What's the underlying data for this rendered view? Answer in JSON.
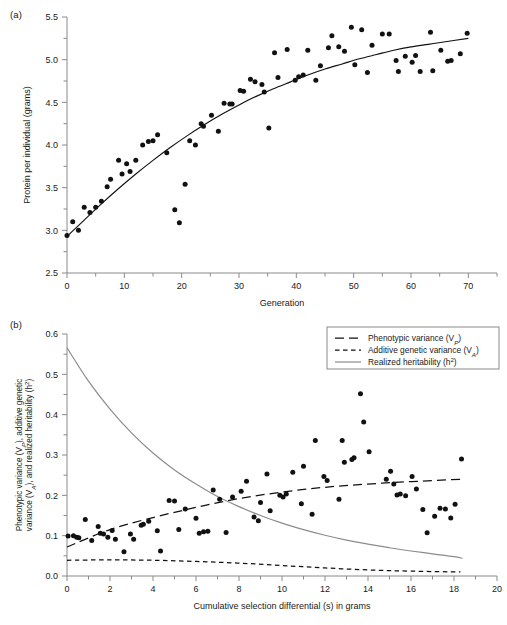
{
  "figure": {
    "panel_a_label": "(a)",
    "panel_b_label": "(b)"
  },
  "chart_data": [
    {
      "id": "panel-a",
      "type": "scatter",
      "title": "",
      "xlabel": "Generation",
      "ylabel": "Protein per individual (grams)",
      "xlim": [
        0,
        75
      ],
      "ylim": [
        2.5,
        5.5
      ],
      "xticks": [
        0,
        10,
        20,
        30,
        40,
        50,
        60,
        70
      ],
      "xticklabels": [
        "0",
        "10",
        "20",
        "30",
        "40",
        "50",
        "60",
        "70"
      ],
      "xminor_step": 5,
      "yticks": [
        2.5,
        3.0,
        3.5,
        4.0,
        4.5,
        5.0,
        5.5
      ],
      "yticklabels": [
        "2.5",
        "3.0",
        "3.5",
        "4.0",
        "4.5",
        "5.0",
        "5.5"
      ],
      "yminor_step": 0.25,
      "grid": false,
      "legend": "none",
      "points": [
        [
          0,
          2.94
        ],
        [
          1,
          3.1
        ],
        [
          2,
          3.0
        ],
        [
          3,
          3.27
        ],
        [
          4,
          3.21
        ],
        [
          5,
          3.27
        ],
        [
          6,
          3.34
        ],
        [
          7,
          3.51
        ],
        [
          7.6,
          3.6
        ],
        [
          9,
          3.82
        ],
        [
          9.6,
          3.66
        ],
        [
          10.4,
          3.78
        ],
        [
          11,
          3.69
        ],
        [
          12,
          3.82
        ],
        [
          13.2,
          4.0
        ],
        [
          14.2,
          4.04
        ],
        [
          15,
          4.05
        ],
        [
          15.8,
          4.12
        ],
        [
          17.4,
          3.91
        ],
        [
          18.8,
          3.24
        ],
        [
          19.6,
          3.09
        ],
        [
          20.6,
          3.54
        ],
        [
          21.4,
          4.05
        ],
        [
          22.4,
          4.0
        ],
        [
          23.4,
          4.25
        ],
        [
          23.8,
          4.22
        ],
        [
          25.2,
          4.35
        ],
        [
          26.4,
          4.16
        ],
        [
          27.4,
          4.49
        ],
        [
          28.4,
          4.48
        ],
        [
          28.8,
          4.48
        ],
        [
          30.2,
          4.64
        ],
        [
          30.8,
          4.63
        ],
        [
          32.0,
          4.77
        ],
        [
          32.8,
          4.74
        ],
        [
          34.0,
          4.71
        ],
        [
          34.4,
          4.62
        ],
        [
          35.2,
          4.2
        ],
        [
          36.2,
          5.08
        ],
        [
          36.8,
          4.79
        ],
        [
          38.4,
          5.12
        ],
        [
          39.8,
          4.76
        ],
        [
          40.4,
          4.8
        ],
        [
          41.2,
          4.82
        ],
        [
          42.0,
          5.11
        ],
        [
          43.4,
          4.76
        ],
        [
          44.2,
          4.93
        ],
        [
          45.6,
          5.14
        ],
        [
          46.2,
          5.28
        ],
        [
          47.4,
          5.15
        ],
        [
          48.4,
          5.1
        ],
        [
          49.6,
          5.38
        ],
        [
          50.2,
          4.94
        ],
        [
          51.4,
          5.35
        ],
        [
          52.4,
          4.85
        ],
        [
          53.2,
          5.17
        ],
        [
          55.0,
          5.3
        ],
        [
          56.2,
          5.3
        ],
        [
          57.4,
          4.99
        ],
        [
          57.8,
          4.86
        ],
        [
          59.0,
          5.04
        ],
        [
          60.2,
          4.97
        ],
        [
          60.8,
          5.05
        ],
        [
          61.6,
          4.86
        ],
        [
          63.4,
          5.32
        ],
        [
          63.8,
          4.87
        ],
        [
          65.2,
          5.11
        ],
        [
          66.4,
          4.98
        ],
        [
          67.0,
          4.99
        ],
        [
          68.6,
          5.07
        ],
        [
          69.8,
          5.31
        ]
      ],
      "curves": [
        {
          "name": "fitted-curve",
          "style": "solid-black",
          "points": [
            [
              0,
              2.93
            ],
            [
              3,
              3.12
            ],
            [
              6,
              3.31
            ],
            [
              9,
              3.49
            ],
            [
              12,
              3.66
            ],
            [
              15,
              3.82
            ],
            [
              18,
              3.97
            ],
            [
              21,
              4.11
            ],
            [
              24,
              4.24
            ],
            [
              27,
              4.36
            ],
            [
              30,
              4.47
            ],
            [
              33,
              4.57
            ],
            [
              36,
              4.66
            ],
            [
              39,
              4.74
            ],
            [
              42,
              4.82
            ],
            [
              45,
              4.89
            ],
            [
              48,
              4.95
            ],
            [
              51,
              5.01
            ],
            [
              54,
              5.06
            ],
            [
              57,
              5.11
            ],
            [
              60,
              5.15
            ],
            [
              63,
              5.18
            ],
            [
              66,
              5.21
            ],
            [
              70,
              5.25
            ]
          ]
        }
      ]
    },
    {
      "id": "panel-b",
      "type": "scatter",
      "title": "",
      "xlabel": "Cumulative selection differential (s) in grams",
      "ylabel": "Phenotypic variance (Vₚ), additive genetic variance (Vₐ), and realized heritability (h²)",
      "ylabel_line1": "Phenotypic variance (V",
      "ylabel_line1_sub": "P",
      "ylabel_line1_rest": "), additive genetic",
      "ylabel_line2": "variance (V",
      "ylabel_line2_sub": "A",
      "ylabel_line2_rest": "), and realized heritability (h",
      "ylabel_line2_sup": "2",
      "ylabel_line2_end": ")",
      "xlim": [
        0,
        20
      ],
      "ylim": [
        0.0,
        0.6
      ],
      "xticks": [
        0,
        2,
        4,
        6,
        8,
        10,
        12,
        14,
        16,
        18,
        20
      ],
      "xticklabels": [
        "0",
        "2",
        "4",
        "6",
        "8",
        "10",
        "12",
        "14",
        "16",
        "18",
        "20"
      ],
      "xminor_step": 1,
      "yticks": [
        0.0,
        0.1,
        0.2,
        0.3,
        0.4,
        0.5,
        0.6
      ],
      "yticklabels": [
        "0.0",
        "0.1",
        "0.2",
        "0.3",
        "0.4",
        "0.5",
        "0.6"
      ],
      "yminor_step": 0.05,
      "grid": false,
      "legend": "upper-right",
      "legend_items": [
        {
          "label_pre": "Phenotypic variance (V",
          "label_sub": "P",
          "label_post": ")",
          "style": "long-dash",
          "full": "Phenotypic variance (VP)"
        },
        {
          "label_pre": "Additive genetic variance (V",
          "label_sub": "A",
          "label_post": ")",
          "style": "short-dash",
          "full": "Additive genetic variance (VA)"
        },
        {
          "label_pre": "Realized heritability (h",
          "label_sup": "2",
          "label_post": ")",
          "style": "solid-grey",
          "full": "Realized heritability (h2)"
        }
      ],
      "points": [
        [
          0.05,
          0.099
        ],
        [
          0.3,
          0.1
        ],
        [
          0.45,
          0.096
        ],
        [
          0.55,
          0.095
        ],
        [
          0.85,
          0.14
        ],
        [
          1.15,
          0.088
        ],
        [
          1.45,
          0.123
        ],
        [
          1.55,
          0.106
        ],
        [
          1.7,
          0.104
        ],
        [
          1.9,
          0.096
        ],
        [
          2.1,
          0.113
        ],
        [
          2.25,
          0.091
        ],
        [
          2.65,
          0.06
        ],
        [
          2.95,
          0.104
        ],
        [
          3.1,
          0.091
        ],
        [
          3.45,
          0.126
        ],
        [
          3.55,
          0.128
        ],
        [
          3.8,
          0.136
        ],
        [
          4.2,
          0.112
        ],
        [
          4.35,
          0.062
        ],
        [
          4.75,
          0.187
        ],
        [
          5.0,
          0.186
        ],
        [
          5.2,
          0.115
        ],
        [
          5.5,
          0.166
        ],
        [
          6.0,
          0.143
        ],
        [
          6.15,
          0.106
        ],
        [
          6.35,
          0.11
        ],
        [
          6.55,
          0.111
        ],
        [
          6.8,
          0.213
        ],
        [
          7.1,
          0.19
        ],
        [
          7.4,
          0.108
        ],
        [
          7.7,
          0.196
        ],
        [
          8.1,
          0.21
        ],
        [
          8.35,
          0.235
        ],
        [
          8.7,
          0.146
        ],
        [
          8.9,
          0.137
        ],
        [
          9.0,
          0.182
        ],
        [
          9.3,
          0.253
        ],
        [
          9.45,
          0.162
        ],
        [
          9.9,
          0.2
        ],
        [
          10.05,
          0.196
        ],
        [
          10.2,
          0.203
        ],
        [
          10.5,
          0.257
        ],
        [
          10.9,
          0.179
        ],
        [
          11.0,
          0.272
        ],
        [
          11.4,
          0.153
        ],
        [
          11.55,
          0.336
        ],
        [
          11.95,
          0.247
        ],
        [
          12.1,
          0.237
        ],
        [
          12.65,
          0.19
        ],
        [
          12.8,
          0.336
        ],
        [
          12.9,
          0.282
        ],
        [
          13.25,
          0.289
        ],
        [
          13.35,
          0.293
        ],
        [
          13.65,
          0.452
        ],
        [
          13.8,
          0.382
        ],
        [
          14.05,
          0.308
        ],
        [
          14.85,
          0.24
        ],
        [
          15.05,
          0.26
        ],
        [
          15.2,
          0.228
        ],
        [
          15.35,
          0.201
        ],
        [
          15.5,
          0.203
        ],
        [
          15.75,
          0.199
        ],
        [
          16.05,
          0.247
        ],
        [
          16.25,
          0.216
        ],
        [
          16.55,
          0.165
        ],
        [
          16.75,
          0.107
        ],
        [
          17.1,
          0.148
        ],
        [
          17.35,
          0.168
        ],
        [
          17.6,
          0.166
        ],
        [
          17.85,
          0.144
        ],
        [
          18.05,
          0.178
        ],
        [
          18.35,
          0.29
        ]
      ],
      "curves": [
        {
          "name": "phenotypic-variance",
          "style": "long-dash",
          "points": [
            [
              0.0,
              0.072
            ],
            [
              2.0,
              0.115
            ],
            [
              4.0,
              0.145
            ],
            [
              6.0,
              0.17
            ],
            [
              8.0,
              0.192
            ],
            [
              10.0,
              0.208
            ],
            [
              12.0,
              0.22
            ],
            [
              14.0,
              0.228
            ],
            [
              16.0,
              0.234
            ],
            [
              18.4,
              0.24
            ]
          ]
        },
        {
          "name": "additive-genetic-variance",
          "style": "short-dash",
          "points": [
            [
              0.0,
              0.039
            ],
            [
              2.0,
              0.04
            ],
            [
              4.0,
              0.039
            ],
            [
              6.0,
              0.036
            ],
            [
              8.0,
              0.032
            ],
            [
              10.0,
              0.026
            ],
            [
              12.0,
              0.02
            ],
            [
              14.0,
              0.015
            ],
            [
              16.0,
              0.012
            ],
            [
              18.3,
              0.01
            ]
          ]
        },
        {
          "name": "realized-heritability",
          "style": "solid-grey",
          "points": [
            [
              0.0,
              0.566
            ],
            [
              1.0,
              0.483
            ],
            [
              2.0,
              0.414
            ],
            [
              3.0,
              0.355
            ],
            [
              4.0,
              0.305
            ],
            [
              5.0,
              0.263
            ],
            [
              6.0,
              0.228
            ],
            [
              7.0,
              0.197
            ],
            [
              8.0,
              0.172
            ],
            [
              9.0,
              0.15
            ],
            [
              10.0,
              0.131
            ],
            [
              11.0,
              0.115
            ],
            [
              12.0,
              0.101
            ],
            [
              13.0,
              0.089
            ],
            [
              14.0,
              0.079
            ],
            [
              15.0,
              0.07
            ],
            [
              16.0,
              0.062
            ],
            [
              17.0,
              0.055
            ],
            [
              18.0,
              0.048
            ],
            [
              18.4,
              0.044
            ]
          ]
        }
      ]
    }
  ]
}
